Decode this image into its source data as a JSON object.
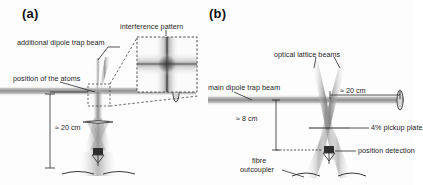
{
  "figure": {
    "background_color": "#fdfdfd",
    "ink_color": "#1d1d1d",
    "beam_color": "#9a9a9a"
  },
  "panel_a": {
    "label": "(a)",
    "annotations": {
      "interference_pattern": "interference pattern",
      "additional_dipole_trap_beam": "additional dipole trap beam",
      "position_of_the_atoms": "position of the atoms"
    },
    "dimensions": {
      "vertical_distance": "≈ 20 cm"
    },
    "inset": {
      "name": "interference-pattern-image",
      "description": "cross-shaped fringe pattern"
    }
  },
  "panel_b": {
    "label": "(b)",
    "annotations": {
      "optical_lattice_beams": "optical lattice beams",
      "main_dipole_trap_beam": "main dipole trap beam",
      "pickup_plate": "4% pickup plate",
      "position_detection": "position detection",
      "fibre_outcoupler_line1": "fibre",
      "fibre_outcoupler_line2": "outcoupler"
    },
    "dimensions": {
      "horizontal_distance": "≈ 20 cm",
      "vertical_distance": "≈ 8 cm"
    }
  }
}
